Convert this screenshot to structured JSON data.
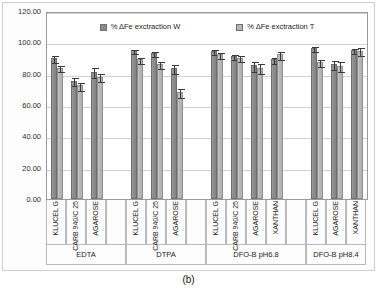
{
  "caption": "(b)",
  "chart_data": {
    "type": "bar",
    "title": "",
    "xlabel": "",
    "ylabel": "",
    "ylim": [
      0,
      120
    ],
    "yticks": [
      "0.00",
      "20.00",
      "40.00",
      "60.00",
      "80.00",
      "100.00",
      "120.00"
    ],
    "grid": true,
    "legend_position": "top-center",
    "legend": [
      "% ΔFe exctraction W",
      "% ΔFe exctraction T"
    ],
    "series": [
      {
        "name": "% ΔFe exctraction W",
        "color": "#8b8b8b",
        "values": [
          89.8,
          75.6,
          81.2,
          94.8,
          93.3,
          83.8,
          94.6,
          91.3,
          85.3,
          89.2,
          96.4,
          86.3,
          95.0
        ],
        "errors": [
          2.6,
          2.6,
          3.4,
          1.7,
          2.0,
          3.3,
          1.8,
          2.0,
          3.6,
          2.3,
          1.8,
          3.2,
          2.1
        ]
      },
      {
        "name": "% ΔFe exctraction T",
        "color": "#b6b6b6",
        "values": [
          83.7,
          72.6,
          78.0,
          89.2,
          86.3,
          68.3,
          92.3,
          90.3,
          83.8,
          92.3,
          87.6,
          85.0,
          94.7
        ],
        "errors": [
          2.2,
          2.8,
          2.9,
          2.2,
          2.4,
          3.0,
          2.0,
          2.1,
          3.6,
          3.1,
          2.4,
          3.6,
          2.8
        ]
      }
    ],
    "groups": [
      {
        "label": "EDTA",
        "categories": [
          "KLUCEL G",
          "CARB 940/C 25",
          "AGAROSE"
        ],
        "trailing_empty": 1
      },
      {
        "label": "DTPA",
        "categories": [
          "KLUCEL G",
          "CARB 940/C 25",
          "AGAROSE"
        ],
        "trailing_empty": 1
      },
      {
        "label": "DFO-B pH6.8",
        "categories": [
          "KLUCEL G",
          "CARB 940/C 25",
          "AGAROSE",
          "XANTHAN"
        ],
        "trailing_empty": 1
      },
      {
        "label": "DFO-B pH8.4",
        "categories": [
          "KLUCEL G",
          "AGAROSE",
          "XANTHAN"
        ],
        "trailing_empty": 0
      }
    ]
  }
}
